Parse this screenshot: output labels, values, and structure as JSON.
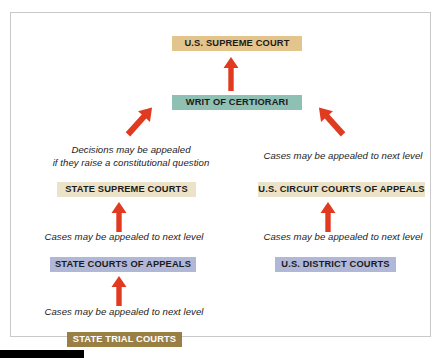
{
  "diagram": {
    "palette": {
      "supreme_court_box": "#e3c48d",
      "writ_box": "#8fc0b4",
      "appellate_box": "#ece2c8",
      "mid_appeals_box": "#b1b7d6",
      "trial_box": "#9a7f45",
      "arrow_red": "#e03a21",
      "frame_border": "#c9c9c9",
      "text_dark": "#1b1b1b",
      "text_light": "#ffffff"
    },
    "nodes": [
      {
        "id": "us-supreme-court",
        "label": "U.S. SUPREME COURT",
        "fill": "#e3c48d",
        "text": "#1b1b1b"
      },
      {
        "id": "writ-of-certiorari",
        "label": "WRIT OF CERTIORARI",
        "fill": "#8fc0b4",
        "text": "#1b1b1b"
      },
      {
        "id": "state-supreme-courts",
        "label": "STATE SUPREME COURTS",
        "fill": "#ece2c8",
        "text": "#1b1b1b"
      },
      {
        "id": "us-circuit-courts-of-appeals",
        "label": "U.S. CIRCUIT COURTS OF APPEALS",
        "fill": "#ece2c8",
        "text": "#1b1b1b"
      },
      {
        "id": "state-courts-of-appeals",
        "label": "STATE COURTS OF APPEALS",
        "fill": "#b1b7d6",
        "text": "#1b1b1b"
      },
      {
        "id": "us-district-courts",
        "label": "U.S. DISTRICT COURTS",
        "fill": "#b1b7d6",
        "text": "#1b1b1b"
      },
      {
        "id": "state-trial-courts",
        "label": "STATE TRIAL COURTS",
        "fill": "#9a7f45",
        "text": "#ffffff"
      }
    ],
    "captions": [
      {
        "id": "constitutional-question",
        "text": "Decisions may be appealed\nif they raise a constitutional question"
      },
      {
        "id": "cert-right",
        "text": "Cases may be appealed to next level"
      },
      {
        "id": "state-appeal",
        "text": "Cases may be appealed to next level"
      },
      {
        "id": "district-appeal",
        "text": "Cases may be appealed to next level"
      },
      {
        "id": "trial-appeal",
        "text": "Cases may be appealed to next level"
      }
    ],
    "arrows": [
      {
        "id": "writ-to-supreme-court",
        "direction": "up",
        "from": "writ-of-certiorari",
        "to": "us-supreme-court"
      },
      {
        "id": "state-supreme-to-writ",
        "direction": "up-right",
        "from": "state-supreme-courts",
        "to": "writ-of-certiorari"
      },
      {
        "id": "circuit-to-writ",
        "direction": "up-left",
        "from": "us-circuit-courts-of-appeals",
        "to": "writ-of-certiorari"
      },
      {
        "id": "state-appeals-to-supreme",
        "direction": "up",
        "from": "state-courts-of-appeals",
        "to": "state-supreme-courts"
      },
      {
        "id": "district-to-circuit",
        "direction": "up",
        "from": "us-district-courts",
        "to": "us-circuit-courts-of-appeals"
      },
      {
        "id": "trial-to-state-appeals",
        "direction": "up",
        "from": "state-trial-courts",
        "to": "state-courts-of-appeals"
      }
    ]
  }
}
